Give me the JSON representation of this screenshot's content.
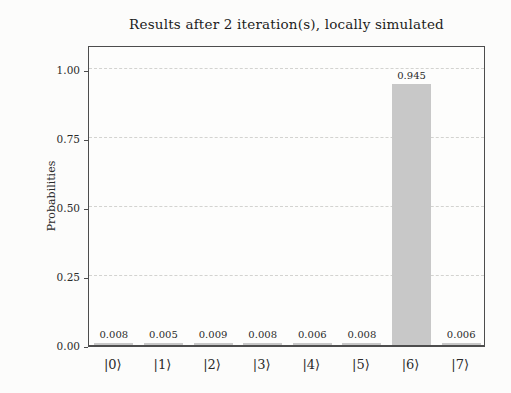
{
  "figure": {
    "title": "Results after 2 iteration(s), locally simulated"
  },
  "chart_data": {
    "type": "bar",
    "title": "Results after 2 iteration(s), locally simulated",
    "ylabel": "Probabilities",
    "xlabel": "",
    "categories": [
      "|0⟩",
      "|1⟩",
      "|2⟩",
      "|3⟩",
      "|4⟩",
      "|5⟩",
      "|6⟩",
      "|7⟩"
    ],
    "values": [
      0.008,
      0.005,
      0.009,
      0.008,
      0.006,
      0.008,
      0.945,
      0.006
    ],
    "value_labels": [
      "0.008",
      "0.005",
      "0.009",
      "0.008",
      "0.006",
      "0.008",
      "0.945",
      "0.006"
    ],
    "yticks": [
      0.0,
      0.25,
      0.5,
      0.75,
      1.0
    ],
    "ytick_labels": [
      "0.00",
      "0.25",
      "0.50",
      "0.75",
      "1.00"
    ],
    "ylim": [
      0,
      1.09
    ],
    "grid": "horizontal-dashed",
    "legend": null,
    "bar_color": "#c8c8c8",
    "background_color": "#fcfcfb",
    "axis_color": "#4d4d4d",
    "text_color": "#262626"
  }
}
